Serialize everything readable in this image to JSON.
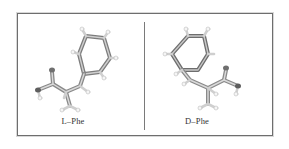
{
  "figure": {
    "panels": [
      {
        "id": "l-phe",
        "label": "L–Phe",
        "molecule": "L-phenylalanine",
        "model": "ball-and-stick"
      },
      {
        "id": "d-phe",
        "label": "D–Phe",
        "molecule": "D-phenylalanine",
        "model": "ball-and-stick"
      }
    ]
  },
  "colors": {
    "frame": "#6e6e6e",
    "bond": "#8c8c8c",
    "bond_highlight": "#d9d9d9",
    "hydrogen": "#f4f4f4",
    "label": "#333333"
  }
}
